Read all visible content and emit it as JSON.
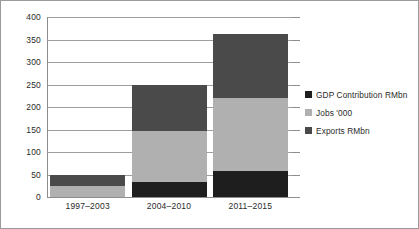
{
  "chart_data": {
    "type": "bar",
    "stacked": true,
    "orientation": "vertical",
    "title": "",
    "subtitle": "",
    "xlabel": "",
    "ylabel": "",
    "categories": [
      "1997–2003",
      "2004–2010",
      "2011–2015"
    ],
    "series": [
      {
        "name": "GDP Contribution RMbn",
        "color": "#1e1e1e",
        "values": [
          0,
          33,
          57
        ]
      },
      {
        "name": "Jobs '000",
        "color": "#b0b0b0",
        "values": [
          25,
          114,
          163
        ]
      },
      {
        "name": "Exports RMbn",
        "color": "#4a4a4a",
        "values": [
          25,
          103,
          142
        ]
      }
    ],
    "stack_order_bottom_to_top": [
      "GDP Contribution RMbn",
      "Jobs '000",
      "Exports RMbn"
    ],
    "totals": [
      50,
      250,
      362
    ],
    "ylim": [
      0,
      400
    ],
    "ytick_interval": 50,
    "yticks": [
      "0",
      "50",
      "100",
      "150",
      "200",
      "250",
      "300",
      "350",
      "400"
    ],
    "grid": true,
    "grid_axis": "y",
    "legend_position": "right",
    "legend": [
      "GDP Contribution RMbn",
      "Jobs '000",
      "Exports RMbn"
    ]
  },
  "style": {
    "plot_background": "#ffffff",
    "frame_color": "#9a9a9a",
    "gridline_color": "#9d9d9d",
    "axis_color": "#8d8d8d",
    "text_color": "#2a2a2a"
  }
}
